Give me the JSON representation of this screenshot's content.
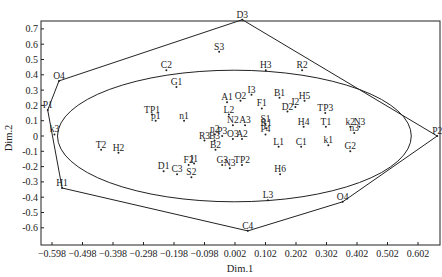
{
  "chart_data": {
    "type": "scatter",
    "title": "",
    "xlabel": "Dim.1",
    "ylabel": "Dim.2",
    "xlim": [
      -0.635,
      0.675
    ],
    "ylim": [
      -0.67,
      0.76
    ],
    "grid": false,
    "legend": null,
    "x_ticks": [
      "-0.598",
      "-0.498",
      "-0.398",
      "-0.298",
      "-0.198",
      "-0.098",
      "0.002",
      "0.102",
      "0.202",
      "0.302",
      "0.402",
      "0.502",
      "0.602"
    ],
    "y_ticks": [
      "0.7",
      "0.6",
      "0.5",
      "0.4",
      "0.3",
      "0.2",
      "0.1",
      "0",
      "-0.1",
      "-0.2",
      "-0.3",
      "-0.4",
      "-0.5",
      "-0.6"
    ],
    "points": [
      {
        "label": "D3",
        "x": 0.026,
        "y": 0.76
      },
      {
        "label": "S3",
        "x": -0.05,
        "y": 0.55
      },
      {
        "label": "C2",
        "x": -0.223,
        "y": 0.43
      },
      {
        "label": "H3",
        "x": 0.103,
        "y": 0.43
      },
      {
        "label": "R2",
        "x": 0.222,
        "y": 0.43
      },
      {
        "label": "O4",
        "x": -0.575,
        "y": 0.36
      },
      {
        "label": "G1",
        "x": -0.19,
        "y": 0.32
      },
      {
        "label": "I3",
        "x": 0.056,
        "y": 0.27
      },
      {
        "label": "B1",
        "x": 0.148,
        "y": 0.25
      },
      {
        "label": "H5",
        "x": 0.23,
        "y": 0.23
      },
      {
        "label": "A1",
        "x": -0.024,
        "y": 0.22
      },
      {
        "label": "O2",
        "x": 0.02,
        "y": 0.23
      },
      {
        "label": "I2",
        "x": 0.2,
        "y": 0.19
      },
      {
        "label": "F1",
        "x": 0.09,
        "y": 0.18
      },
      {
        "label": "D2",
        "x": 0.174,
        "y": 0.16
      },
      {
        "label": "TP3",
        "x": 0.298,
        "y": 0.15
      },
      {
        "label": "P1",
        "x": -0.612,
        "y": 0.17
      },
      {
        "label": "TP1",
        "x": -0.27,
        "y": 0.14
      },
      {
        "label": "p1",
        "x": -0.258,
        "y": 0.1
      },
      {
        "label": "n1",
        "x": -0.165,
        "y": 0.1
      },
      {
        "label": "L2",
        "x": -0.018,
        "y": 0.14
      },
      {
        "label": "N2",
        "x": -0.005,
        "y": 0.07
      },
      {
        "label": "A3",
        "x": 0.035,
        "y": 0.07
      },
      {
        "label": "S1",
        "x": 0.102,
        "y": 0.08
      },
      {
        "label": "R1",
        "x": 0.104,
        "y": 0.05
      },
      {
        "label": "H4",
        "x": 0.227,
        "y": 0.06
      },
      {
        "label": "T1",
        "x": 0.3,
        "y": 0.06
      },
      {
        "label": "k2",
        "x": 0.38,
        "y": 0.06
      },
      {
        "label": "N3",
        "x": 0.41,
        "y": 0.06
      },
      {
        "label": "k3",
        "x": -0.59,
        "y": 0.01
      },
      {
        "label": "n3",
        "x": 0.393,
        "y": 0.02
      },
      {
        "label": "P2",
        "x": 0.665,
        "y": 0.0
      },
      {
        "label": "n2",
        "x": -0.064,
        "y": 0.01
      },
      {
        "label": "P3",
        "x": -0.04,
        "y": 0.0
      },
      {
        "label": "P4",
        "x": 0.102,
        "y": 0.01
      },
      {
        "label": "R3",
        "x": -0.098,
        "y": -0.03
      },
      {
        "label": "B3",
        "x": -0.065,
        "y": -0.03
      },
      {
        "label": "O3",
        "x": -0.005,
        "y": -0.02
      },
      {
        "label": "A2",
        "x": 0.025,
        "y": -0.02
      },
      {
        "label": "L1",
        "x": 0.145,
        "y": -0.07
      },
      {
        "label": "C1",
        "x": 0.219,
        "y": -0.07
      },
      {
        "label": "k1",
        "x": 0.308,
        "y": -0.06
      },
      {
        "label": "T2",
        "x": -0.437,
        "y": -0.09
      },
      {
        "label": "H2",
        "x": -0.38,
        "y": -0.11
      },
      {
        "label": "G2",
        "x": 0.38,
        "y": -0.1
      },
      {
        "label": "B2",
        "x": -0.062,
        "y": -0.09
      },
      {
        "label": "I1",
        "x": -0.132,
        "y": -0.18
      },
      {
        "label": "F2",
        "x": -0.15,
        "y": -0.19
      },
      {
        "label": "G3",
        "x": -0.04,
        "y": -0.19
      },
      {
        "label": "N3",
        "x": -0.015,
        "y": -0.21
      },
      {
        "label": "TP2",
        "x": 0.025,
        "y": -0.19
      },
      {
        "label": "D1",
        "x": -0.232,
        "y": -0.23
      },
      {
        "label": "C3",
        "x": -0.188,
        "y": -0.25
      },
      {
        "label": "S2",
        "x": -0.141,
        "y": -0.27
      },
      {
        "label": "H6",
        "x": 0.15,
        "y": -0.25
      },
      {
        "label": "H1",
        "x": -0.565,
        "y": -0.34
      },
      {
        "label": "L3",
        "x": 0.11,
        "y": -0.42
      },
      {
        "label": "O4",
        "x": 0.355,
        "y": -0.43
      },
      {
        "label": "C4",
        "x": 0.044,
        "y": -0.62
      }
    ],
    "hull_polygon": [
      [
        0.026,
        0.76
      ],
      [
        0.665,
        0.0
      ],
      [
        0.355,
        -0.43
      ],
      [
        0.044,
        -0.62
      ],
      [
        -0.565,
        -0.34
      ],
      [
        -0.612,
        0.17
      ],
      [
        -0.575,
        0.36
      ]
    ],
    "ellipse": {
      "cx": 0.0,
      "cy": 0.0,
      "rx": 0.58,
      "ry": 0.43
    }
  }
}
